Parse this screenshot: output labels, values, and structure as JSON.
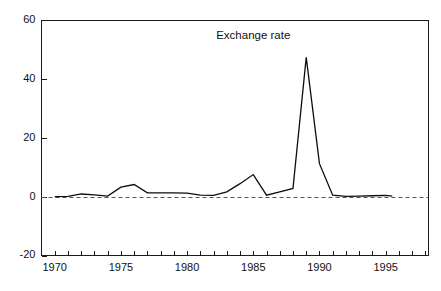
{
  "chart_data": {
    "type": "line",
    "title": "",
    "annotations": [
      {
        "text": "Exchange rate",
        "x": 1985.0,
        "y": 53.5
      }
    ],
    "xlabel": "",
    "ylabel": "",
    "xlim": [
      1969.0,
      1998.2
    ],
    "ylim": [
      -20,
      60
    ],
    "yticks": [
      -20,
      0,
      20,
      40,
      60
    ],
    "ytick_labels": [
      "-20",
      "0",
      "20",
      "40",
      "60"
    ],
    "xticks": [
      1970,
      1971,
      1972,
      1973,
      1974,
      1975,
      1976,
      1977,
      1978,
      1979,
      1980,
      1981,
      1982,
      1983,
      1984,
      1985,
      1986,
      1987,
      1988,
      1989,
      1990,
      1991,
      1992,
      1993,
      1994,
      1995,
      1996,
      1997,
      1998
    ],
    "xtick_labels_shown": [
      {
        "value": 1970,
        "label": "1970"
      },
      {
        "value": 1975,
        "label": "1975"
      },
      {
        "value": 1980,
        "label": "1980"
      },
      {
        "value": 1985,
        "label": "1985"
      },
      {
        "value": 1990,
        "label": "1990"
      },
      {
        "value": 1995,
        "label": "1995"
      }
    ],
    "grid": false,
    "legend_position": "none",
    "reference_lines": [
      {
        "name": "zero-line",
        "value": 0,
        "style": "dashed",
        "orientation": "horizontal"
      }
    ],
    "series": [
      {
        "name": "Exchange rate",
        "x": [
          1970,
          1971,
          1972,
          1973,
          1974,
          1975,
          1976,
          1977,
          1978,
          1979,
          1980,
          1981,
          1982,
          1983,
          1984,
          1985,
          1986,
          1987,
          1988,
          1989,
          1990,
          1991,
          1992,
          1993,
          1994,
          1995,
          1995.5
        ],
        "values": [
          0.0,
          0.1,
          0.9,
          0.6,
          0.2,
          3.2,
          4.1,
          1.3,
          1.3,
          1.3,
          1.2,
          0.5,
          0.4,
          1.6,
          4.4,
          7.5,
          0.5,
          1.6,
          2.8,
          47.3,
          11.2,
          0.5,
          0.1,
          0.2,
          0.3,
          0.4,
          0.2
        ]
      }
    ]
  },
  "labels": {
    "y_axis_name": "y-axis",
    "x_axis_name": "x-axis"
  }
}
